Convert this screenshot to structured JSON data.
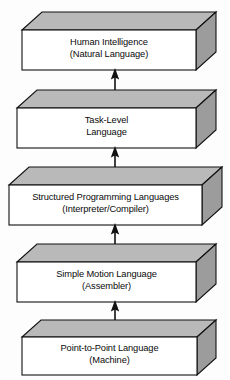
{
  "diagram": {
    "style": "isometric-3d-blocks",
    "background_color": "#fdfdfd",
    "line_color": "#111111",
    "top_face_fill": "#b8b8b8",
    "side_face_fill": "#9a9a9a",
    "front_face_fill": "#ffffff",
    "levels": [
      {
        "id": "human-intelligence",
        "line1": "Human Intelligence",
        "line2": "(Natural Language)"
      },
      {
        "id": "task-level",
        "line1": "Task-Level",
        "line2": "Language"
      },
      {
        "id": "structured-programming",
        "line1": "Structured Programming Languages",
        "line2": "(Interpreter/Compiler)"
      },
      {
        "id": "simple-motion",
        "line1": "Simple Motion Language",
        "line2": "(Assembler)"
      },
      {
        "id": "point-to-point",
        "line1": "Point-to-Point Language",
        "line2": "(Machine)"
      }
    ],
    "arrows": [
      {
        "id": "arrow-point-to-simple",
        "from": "point-to-point",
        "to": "simple-motion",
        "direction": "up"
      },
      {
        "id": "arrow-simple-to-structured",
        "from": "simple-motion",
        "to": "structured-programming",
        "direction": "up"
      },
      {
        "id": "arrow-structured-to-task",
        "from": "structured-programming",
        "to": "task-level",
        "direction": "up"
      },
      {
        "id": "arrow-task-to-human",
        "from": "task-level",
        "to": "human-intelligence",
        "direction": "up"
      }
    ]
  }
}
